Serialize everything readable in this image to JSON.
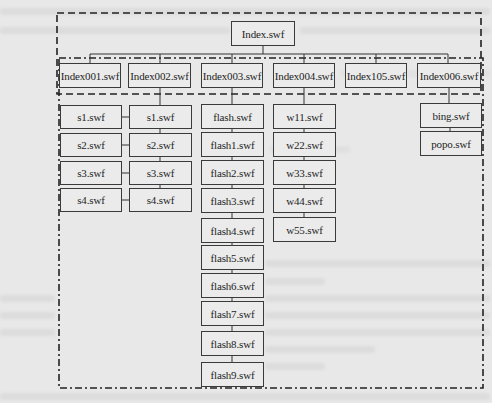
{
  "diagram": {
    "title": "",
    "root": {
      "label": "Index.swf"
    },
    "level1": [
      {
        "label": "Index001.swf"
      },
      {
        "label": "Index002.swf"
      },
      {
        "label": "Index003.swf"
      },
      {
        "label": "Index004.swf"
      },
      {
        "label": "Index105.swf"
      },
      {
        "label": "Index006.swf"
      }
    ],
    "columns": [
      {
        "under": "Index001.swf",
        "linked_to": "Index002.swf column",
        "items": [
          "s1.swf",
          "s2.swf",
          "s3.swf",
          "s4.swf"
        ]
      },
      {
        "under": "Index002.swf",
        "items": [
          "s1.swf",
          "s2.swf",
          "s3.swf",
          "s4.swf"
        ]
      },
      {
        "under": "Index003.swf",
        "items": [
          "flash.swf",
          "flash1.swf",
          "flash2.swf",
          "flash3.swf",
          "flash4.swf",
          "flash5.swf",
          "flash6.swf",
          "flash7.swf",
          "flash8.swf",
          "flash9.swf"
        ]
      },
      {
        "under": "Index004.swf",
        "items": [
          "w11.swf",
          "w22.swf",
          "w33.swf",
          "w44.swf",
          "w55.swf"
        ]
      },
      {
        "under": "Index006.swf",
        "items": [
          "bing.swf",
          "popo.swf"
        ]
      }
    ],
    "groups": [
      {
        "name": "level-1 group",
        "style": "dashed"
      },
      {
        "name": "level-2 group",
        "style": "dash-dot"
      }
    ],
    "colors": {
      "background": "#e8e8e8",
      "stroke": "#333333",
      "text": "#1e1e1e"
    }
  }
}
